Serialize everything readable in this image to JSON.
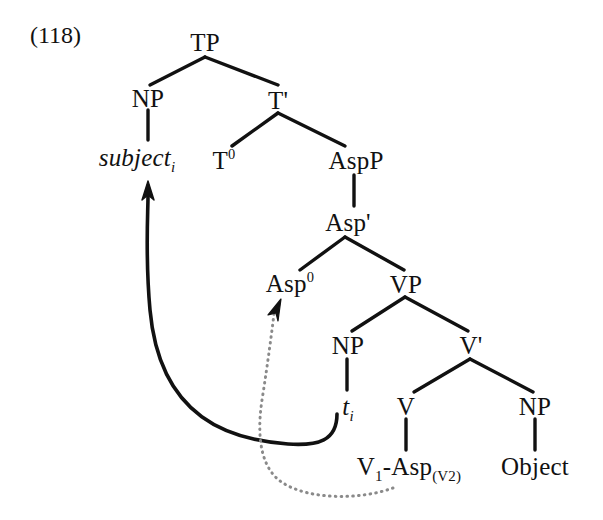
{
  "figure": {
    "example_number": "(118)",
    "type": "syntactic-tree-diagram"
  },
  "nodes": {
    "tp": "TP",
    "np_subject": "NP",
    "t_bar": "T'",
    "t_zero_base": "T",
    "t_zero_sup": "0",
    "aspp": "AspP",
    "asp_bar": "Asp'",
    "asp_zero_base": "Asp",
    "asp_zero_sup": "0",
    "vp": "VP",
    "np_trace": "NP",
    "v_bar": "V'",
    "v_head": "V",
    "np_object": "NP"
  },
  "terminals": {
    "subject_base": "subject",
    "subject_sub": "i",
    "trace_base": "t",
    "trace_sub": "i",
    "verb_complex_v": "V",
    "verb_complex_v_sub": "1",
    "verb_complex_dash": "-Asp",
    "verb_complex_asp_sub": "(V2)",
    "object": "Object"
  },
  "movement": {
    "subject_movement_label": "solid-arrow-np-to-spec-tp",
    "head_movement_label": "dotted-arrow-verb-to-asp",
    "solid_color": "#111111",
    "dotted_color": "#8a8a8a"
  },
  "colors": {
    "background": "#ffffff",
    "ink": "#111111",
    "dotted_ink": "#8a8a8a"
  }
}
